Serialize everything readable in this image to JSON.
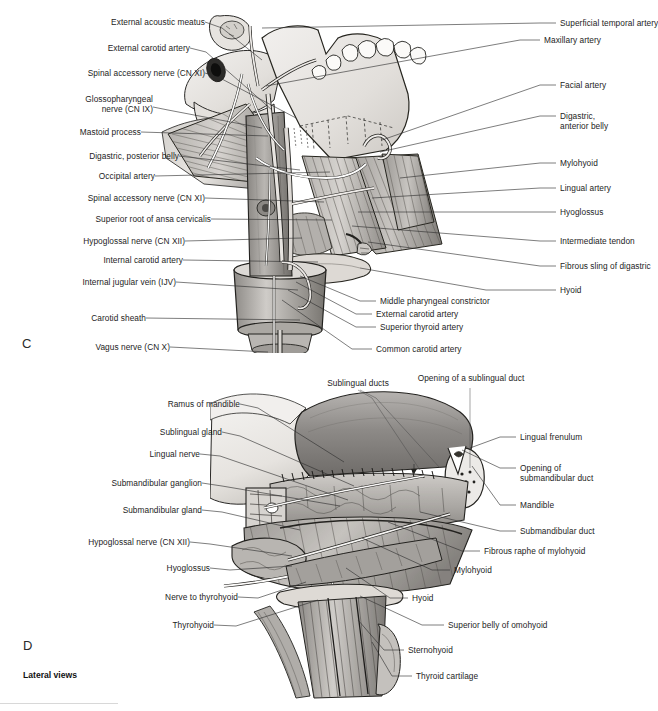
{
  "figure": {
    "caption": "Lateral views",
    "panels": [
      {
        "letter": "C",
        "name": "panel-c"
      },
      {
        "letter": "D",
        "name": "panel-d"
      }
    ]
  },
  "panel_c": {
    "letter": "C",
    "labels_left": [
      {
        "id": "external-acoustic-meatus",
        "text": "External acoustic meatus"
      },
      {
        "id": "external-carotid-artery-upper",
        "text": "External carotid artery"
      },
      {
        "id": "spinal-accessory-nerve-cn-xi-upper",
        "text": "Spinal accessory nerve (CN XI)"
      },
      {
        "id": "glossopharyngeal-nerve-cn-ix-line1",
        "text": "Glossopharyngeal"
      },
      {
        "id": "glossopharyngeal-nerve-cn-ix-line2",
        "text": "nerve (CN IX)"
      },
      {
        "id": "mastoid-process",
        "text": "Mastoid process"
      },
      {
        "id": "digastric-posterior-belly",
        "text": "Digastric, posterior belly"
      },
      {
        "id": "occipital-artery",
        "text": "Occipital artery"
      },
      {
        "id": "spinal-accessory-nerve-cn-xi-lower",
        "text": "Spinal accessory nerve (CN XI)"
      },
      {
        "id": "superior-root-of-ansa-cervicalis",
        "text": "Superior root of ansa cervicalis"
      },
      {
        "id": "hypoglossal-nerve-cn-xii",
        "text": "Hypoglossal nerve (CN XII)"
      },
      {
        "id": "internal-carotid-artery",
        "text": "Internal carotid artery"
      },
      {
        "id": "internal-jugular-vein-ijv",
        "text": "Internal jugular vein (IJV)"
      },
      {
        "id": "carotid-sheath",
        "text": "Carotid sheath"
      },
      {
        "id": "vagus-nerve-cn-x",
        "text": "Vagus nerve (CN X)"
      }
    ],
    "labels_right": [
      {
        "id": "superficial-temporal-artery",
        "text": "Superficial temporal artery"
      },
      {
        "id": "maxillary-artery",
        "text": "Maxillary artery"
      },
      {
        "id": "facial-artery",
        "text": "Facial artery"
      },
      {
        "id": "digastric-anterior-belly-line1",
        "text": "Digastric,"
      },
      {
        "id": "digastric-anterior-belly-line2",
        "text": "anterior belly"
      },
      {
        "id": "mylohyoid",
        "text": "Mylohyoid"
      },
      {
        "id": "lingual-artery",
        "text": "Lingual artery"
      },
      {
        "id": "hyoglossus",
        "text": "Hyoglossus"
      },
      {
        "id": "intermediate-tendon",
        "text": "Intermediate tendon"
      },
      {
        "id": "fibrous-sling-of-digastric",
        "text": "Fibrous sling of digastric"
      },
      {
        "id": "hyoid",
        "text": "Hyoid"
      }
    ],
    "labels_bottom": [
      {
        "id": "middle-pharyngeal-constrictor",
        "text": "Middle pharyngeal constrictor"
      },
      {
        "id": "external-carotid-artery-lower",
        "text": "External carotid artery"
      },
      {
        "id": "superior-thyroid-artery",
        "text": "Superior thyroid artery"
      },
      {
        "id": "common-carotid-artery",
        "text": "Common carotid artery"
      }
    ]
  },
  "panel_d": {
    "letter": "D",
    "labels_left": [
      {
        "id": "ramus-of-mandible",
        "text": "Ramus of mandible"
      },
      {
        "id": "sublingual-gland",
        "text": "Sublingual gland"
      },
      {
        "id": "lingual-nerve",
        "text": "Lingual nerve"
      },
      {
        "id": "submandibular-ganglion",
        "text": "Submandibular ganglion"
      },
      {
        "id": "submandibular-gland",
        "text": "Submandibular gland"
      },
      {
        "id": "hypoglossal-nerve-cn-xii-d",
        "text": "Hypoglossal nerve (CN XII)"
      },
      {
        "id": "hyoglossus-d",
        "text": "Hyoglossus"
      },
      {
        "id": "nerve-to-thyrohyoid",
        "text": "Nerve to thyrohyoid"
      },
      {
        "id": "thyrohyoid",
        "text": "Thyrohyoid"
      }
    ],
    "labels_top": [
      {
        "id": "sublingual-ducts",
        "text": "Sublingual ducts"
      },
      {
        "id": "opening-of-a-sublingual-duct",
        "text": "Opening of a sublingual duct"
      }
    ],
    "labels_right": [
      {
        "id": "lingual-frenulum",
        "text": "Lingual frenulum"
      },
      {
        "id": "opening-of-submandibular-duct-line1",
        "text": "Opening of"
      },
      {
        "id": "opening-of-submandibular-duct-line2",
        "text": "submandibular duct"
      },
      {
        "id": "mandible",
        "text": "Mandible"
      },
      {
        "id": "submandibular-duct",
        "text": "Submandibular duct"
      },
      {
        "id": "fibrous-raphe-of-mylohyoid",
        "text": "Fibrous raphe of mylohyoid"
      },
      {
        "id": "mylohyoid-d",
        "text": "Mylohyoid"
      },
      {
        "id": "hyoid-d",
        "text": "Hyoid"
      },
      {
        "id": "superior-belly-of-omohyoid",
        "text": "Superior belly of omohyoid"
      },
      {
        "id": "sternohyoid",
        "text": "Sternohyoid"
      },
      {
        "id": "thyroid-cartilage",
        "text": "Thyroid cartilage"
      }
    ]
  },
  "colors": {
    "background": "#ffffff",
    "ink": "#1d1d1d",
    "leader": "#2e2e2e",
    "bone_light": "#e9e7e4",
    "bone_mid": "#d5d2ce",
    "muscle_light": "#c9c6c2",
    "muscle_mid": "#a9a6a2",
    "muscle_dark": "#7c7975",
    "vessel_light": "#efeeec",
    "vessel_dark": "#6f6d6a",
    "gland_mid": "#b4b1ad",
    "tongue_mid": "#9d9a97",
    "outline": "#23221f"
  }
}
